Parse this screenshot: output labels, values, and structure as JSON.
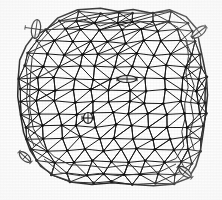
{
  "figure": {
    "title": "Unstructured triangular mesh on irregular domain",
    "kind": "finite-element-mesh-diagram",
    "background_color": "#ffffff",
    "line_color": "#1a1a1a",
    "node_color": "#111111",
    "marker_color": "#1a1a1a",
    "contour_color": "#333333",
    "image_width": 222,
    "image_height": 200,
    "render_style": "scanned-grayscale-bitmap"
  },
  "domain_boundary": {
    "name": "outer-boundary-polygon",
    "closed": true,
    "stroke_width": 1.5,
    "points": [
      [
        46,
        30
      ],
      [
        58,
        18
      ],
      [
        78,
        10
      ],
      [
        100,
        8
      ],
      [
        118,
        12
      ],
      [
        133,
        9
      ],
      [
        152,
        13
      ],
      [
        170,
        10
      ],
      [
        186,
        16
      ],
      [
        196,
        28
      ],
      [
        200,
        44
      ],
      [
        203,
        60
      ],
      [
        206,
        78
      ],
      [
        207,
        96
      ],
      [
        205,
        114
      ],
      [
        203,
        132
      ],
      [
        200,
        150
      ],
      [
        196,
        166
      ],
      [
        188,
        178
      ],
      [
        172,
        184
      ],
      [
        154,
        186
      ],
      [
        134,
        184
      ],
      [
        112,
        183
      ],
      [
        92,
        184
      ],
      [
        72,
        182
      ],
      [
        54,
        176
      ],
      [
        40,
        166
      ],
      [
        30,
        150
      ],
      [
        24,
        132
      ],
      [
        20,
        114
      ],
      [
        18,
        96
      ],
      [
        18,
        78
      ],
      [
        20,
        60
      ],
      [
        26,
        46
      ],
      [
        34,
        36
      ]
    ]
  },
  "inner_contours": [
    {
      "name": "inner-contour-upper",
      "closed": true,
      "stroke_width": 1,
      "points": [
        [
          38,
          44
        ],
        [
          50,
          30
        ],
        [
          66,
          22
        ],
        [
          84,
          20
        ],
        [
          100,
          26
        ],
        [
          112,
          22
        ],
        [
          126,
          26
        ],
        [
          140,
          22
        ],
        [
          154,
          26
        ],
        [
          166,
          22
        ],
        [
          178,
          28
        ],
        [
          186,
          40
        ],
        [
          188,
          56
        ],
        [
          186,
          72
        ],
        [
          188,
          88
        ],
        [
          184,
          104
        ],
        [
          186,
          118
        ],
        [
          182,
          132
        ],
        [
          184,
          146
        ],
        [
          176,
          158
        ],
        [
          160,
          166
        ],
        [
          142,
          168
        ],
        [
          124,
          166
        ],
        [
          106,
          168
        ],
        [
          88,
          166
        ],
        [
          70,
          164
        ],
        [
          54,
          156
        ],
        [
          42,
          144
        ],
        [
          34,
          128
        ],
        [
          30,
          110
        ],
        [
          30,
          92
        ],
        [
          30,
          74
        ],
        [
          32,
          58
        ]
      ]
    },
    {
      "name": "inner-contour-left-loop",
      "closed": false,
      "stroke_width": 1,
      "points": [
        [
          30,
          52
        ],
        [
          26,
          66
        ],
        [
          28,
          84
        ],
        [
          26,
          100
        ],
        [
          30,
          116
        ],
        [
          28,
          132
        ],
        [
          34,
          146
        ]
      ]
    },
    {
      "name": "inner-contour-right-loop",
      "closed": false,
      "stroke_width": 1,
      "points": [
        [
          186,
          40
        ],
        [
          192,
          54
        ],
        [
          188,
          70
        ],
        [
          194,
          86
        ],
        [
          190,
          102
        ],
        [
          194,
          118
        ],
        [
          190,
          134
        ],
        [
          194,
          150
        ]
      ]
    },
    {
      "name": "inner-contour-bottom",
      "closed": false,
      "stroke_width": 1,
      "points": [
        [
          44,
          160
        ],
        [
          60,
          172
        ],
        [
          80,
          176
        ],
        [
          100,
          174
        ],
        [
          120,
          176
        ],
        [
          140,
          174
        ],
        [
          160,
          172
        ],
        [
          176,
          164
        ]
      ]
    }
  ],
  "mesh": {
    "name": "triangular-mesh",
    "edge_stroke_width": 1,
    "node_radius": 1.4,
    "node_count": 122,
    "rows": [
      {
        "y": 12,
        "xs": [
          78,
          100,
          118,
          134,
          152,
          170
        ]
      },
      {
        "y": 22,
        "xs": [
          58,
          76,
          96,
          116,
          134,
          152,
          170,
          186
        ]
      },
      {
        "y": 30,
        "xs": [
          46,
          64,
          82,
          100,
          120,
          140,
          158,
          176,
          192
        ]
      },
      {
        "y": 42,
        "xs": [
          36,
          54,
          72,
          90,
          108,
          126,
          144,
          162,
          180,
          196
        ]
      },
      {
        "y": 54,
        "xs": [
          28,
          46,
          64,
          82,
          100,
          118,
          136,
          154,
          172,
          190,
          202
        ]
      },
      {
        "y": 66,
        "xs": [
          24,
          42,
          60,
          78,
          96,
          114,
          132,
          150,
          168,
          186,
          202
        ]
      },
      {
        "y": 78,
        "xs": [
          20,
          38,
          56,
          74,
          92,
          110,
          128,
          146,
          164,
          182,
          198,
          206
        ]
      },
      {
        "y": 90,
        "xs": [
          20,
          38,
          56,
          74,
          92,
          110,
          128,
          146,
          164,
          182,
          198,
          206
        ]
      },
      {
        "y": 102,
        "xs": [
          20,
          38,
          56,
          74,
          92,
          110,
          128,
          146,
          164,
          182,
          198,
          206
        ]
      },
      {
        "y": 114,
        "xs": [
          22,
          40,
          58,
          76,
          94,
          112,
          130,
          148,
          166,
          184,
          200,
          206
        ]
      },
      {
        "y": 126,
        "xs": [
          24,
          42,
          60,
          78,
          96,
          114,
          132,
          150,
          168,
          186,
          202
        ]
      },
      {
        "y": 138,
        "xs": [
          26,
          44,
          62,
          80,
          98,
          116,
          134,
          152,
          170,
          188,
          202
        ]
      },
      {
        "y": 150,
        "xs": [
          30,
          48,
          66,
          84,
          102,
          120,
          138,
          156,
          174,
          190,
          200
        ]
      },
      {
        "y": 162,
        "xs": [
          38,
          56,
          74,
          92,
          110,
          128,
          146,
          164,
          180,
          194
        ]
      },
      {
        "y": 174,
        "xs": [
          50,
          68,
          86,
          104,
          122,
          140,
          158,
          174,
          188
        ]
      },
      {
        "y": 183,
        "xs": [
          72,
          92,
          112,
          134,
          154,
          172
        ]
      }
    ]
  },
  "markers": [
    {
      "id": "marker-top-left",
      "name": "ellipse-marker-vertical",
      "cx": 36,
      "cy": 29,
      "rx": 4.5,
      "ry": 9.5,
      "rotation": 8,
      "has_axis_tick": true,
      "axis_length": 22,
      "description": "vertical lens-shaped marker near upper-left boundary node"
    },
    {
      "id": "marker-top-right",
      "name": "ellipse-marker-diagonal",
      "cx": 199,
      "cy": 32,
      "rx": 8.5,
      "ry": 4.0,
      "rotation": -38,
      "has_axis_tick": true,
      "axis_length": 18,
      "description": "tilted ellipse marker at upper-right boundary node"
    },
    {
      "id": "marker-center",
      "name": "ellipse-marker-horizontal",
      "cx": 127,
      "cy": 79,
      "rx": 9.5,
      "ry": 3.5,
      "rotation": 0,
      "has_axis_tick": true,
      "axis_length": 20,
      "description": "horizontal flat ellipse marker in mid-upper interior"
    },
    {
      "id": "marker-interior",
      "name": "ellipse-marker-circular",
      "cx": 88,
      "cy": 118,
      "rx": 4.5,
      "ry": 5.5,
      "rotation": 0,
      "has_axis_tick": true,
      "axis_length": 12,
      "description": "small near-circular marker in interior"
    },
    {
      "id": "marker-bottom-left",
      "name": "ellipse-marker-diagonal-lower",
      "cx": 25,
      "cy": 157,
      "rx": 7.0,
      "ry": 3.5,
      "rotation": 42,
      "has_axis_tick": true,
      "axis_length": 16,
      "description": "tilted ellipse marker near lower-left boundary node"
    },
    {
      "id": "marker-bottom-right",
      "name": "ellipse-marker-diagonal-bottom-right",
      "cx": 185,
      "cy": 172,
      "rx": 7.5,
      "ry": 3.5,
      "rotation": 40,
      "has_axis_tick": true,
      "axis_length": 18,
      "description": "tilted ellipse marker near lower-right boundary node"
    }
  ],
  "legend": {
    "visible": false,
    "entries": []
  },
  "axis_labels": {
    "visible": false,
    "x": "",
    "y": ""
  }
}
